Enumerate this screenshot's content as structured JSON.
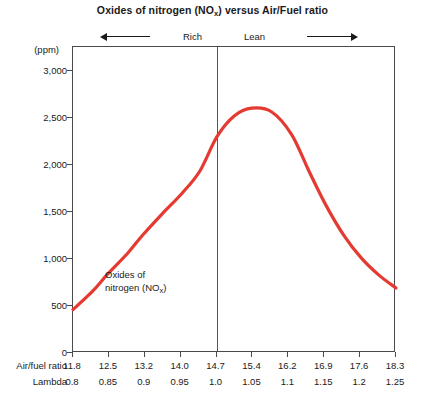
{
  "chart_data": {
    "type": "line",
    "title": "Oxides of nitrogen (NOx) versus Air/Fuel ratio",
    "title_main": "Oxides of nitrogen (NO",
    "title_sub": "x",
    "title_tail": ") versus Air/Fuel ratio",
    "xlabel": "Air/fuel ratio",
    "xlabel_secondary": "Lambda",
    "ylabel": "(ppm)",
    "ylim": [
      0,
      3250
    ],
    "yticks": [
      0,
      500,
      1000,
      1500,
      2000,
      2500,
      3000
    ],
    "ytick_labels": [
      "0",
      "500",
      "1,000",
      "1,500",
      "2,000",
      "2,500",
      "3,000"
    ],
    "grid": false,
    "legend": "none",
    "xlim": [
      11.8,
      18.3
    ],
    "categories": [
      "11.8",
      "12.5",
      "13.2",
      "14.0",
      "14.7",
      "15.4",
      "16.2",
      "16.9",
      "17.6",
      "18.3"
    ],
    "xtick_labels_lambda": [
      "0.8",
      "0.85",
      "0.9",
      "0.95",
      "1.0",
      "1.05",
      "1.1",
      "1.15",
      "1.2",
      "1.25"
    ],
    "series": [
      {
        "name": "Oxides of nitrogen (NOx)",
        "color": "#E43A32",
        "x": [
          11.8,
          12.2,
          12.5,
          12.9,
          13.2,
          13.6,
          14.0,
          14.35,
          14.7,
          15.05,
          15.4,
          15.8,
          16.2,
          16.55,
          16.9,
          17.25,
          17.6,
          17.95,
          18.3
        ],
        "values": [
          460,
          660,
          840,
          1060,
          1250,
          1480,
          1700,
          1930,
          2300,
          2520,
          2600,
          2560,
          2320,
          1930,
          1560,
          1250,
          1010,
          830,
          690
        ]
      }
    ],
    "annotations": [
      {
        "name": "series-label",
        "line1": "Oxides of",
        "line2_main": "nitrogen (NO",
        "line2_sub": "x",
        "line2_tail": ")"
      },
      {
        "name": "mixture-rich",
        "label": "Rich",
        "arrow": "left"
      },
      {
        "name": "mixture-lean",
        "label": "Lean",
        "arrow": "right"
      }
    ],
    "reference_line": {
      "name": "stoichiometric",
      "air_fuel_ratio": 14.7,
      "lambda": 1.0
    },
    "colors": {
      "curve": "#E43A32",
      "axis": "#4a4a4a",
      "text": "#1a1a1a",
      "background": "#ffffff"
    }
  }
}
